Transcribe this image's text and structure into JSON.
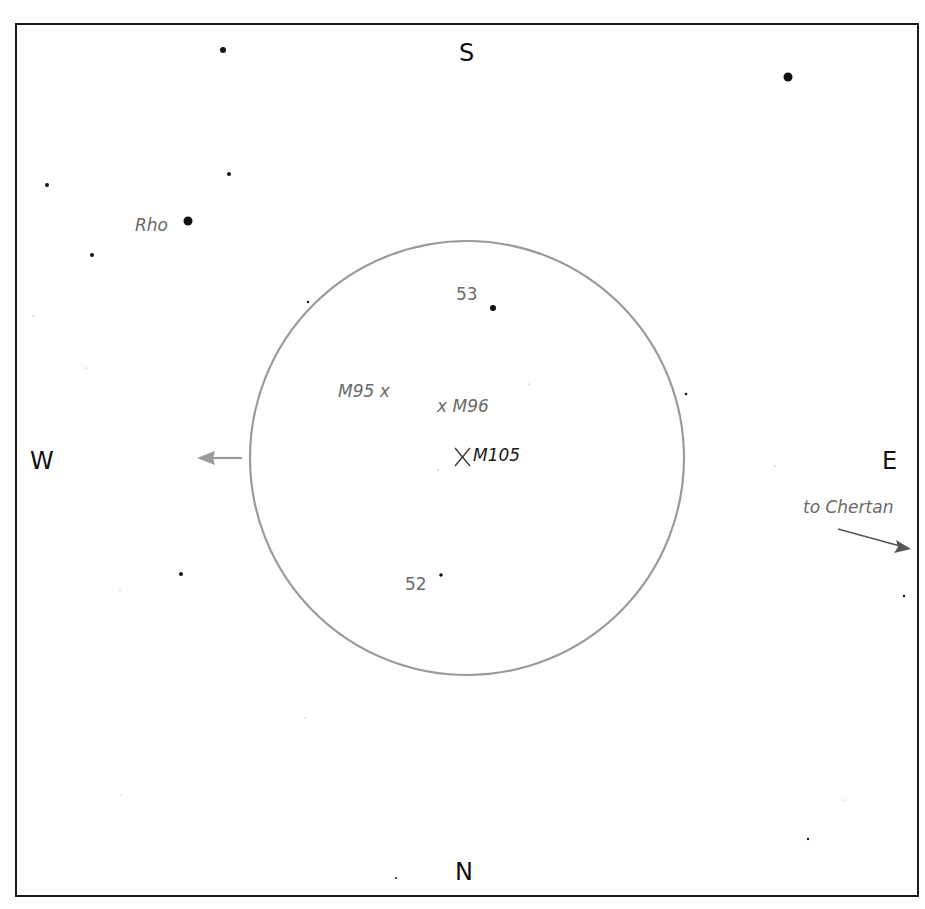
{
  "directions": {
    "north": "N",
    "south": "S",
    "east": "E",
    "west": "W"
  },
  "field_of_view": {
    "center": [
      467,
      458
    ],
    "radius": 217,
    "color": "#9a9a9a"
  },
  "objects": {
    "m105": {
      "label": "M105",
      "marker": "x-cross-icon"
    },
    "m96": {
      "label": "x M96"
    },
    "m95": {
      "label": "M95 x"
    }
  },
  "stars": {
    "rho": {
      "label": "Rho"
    },
    "star53": {
      "label": "53"
    },
    "star52": {
      "label": "52"
    }
  },
  "annotations": {
    "to_chertan": "to Chertan"
  },
  "star_points": [
    {
      "x": 223,
      "y": 50,
      "r": 3
    },
    {
      "x": 788,
      "y": 77,
      "r": 4.5
    },
    {
      "x": 47,
      "y": 185,
      "r": 2
    },
    {
      "x": 229,
      "y": 174,
      "r": 2
    },
    {
      "x": 188,
      "y": 221,
      "r": 4.5
    },
    {
      "x": 92,
      "y": 255,
      "r": 2
    },
    {
      "x": 493,
      "y": 308,
      "r": 3
    },
    {
      "x": 308,
      "y": 302,
      "r": 1.2
    },
    {
      "x": 686,
      "y": 394,
      "r": 1.3
    },
    {
      "x": 181,
      "y": 574,
      "r": 2
    },
    {
      "x": 441,
      "y": 575,
      "r": 1.8
    },
    {
      "x": 904,
      "y": 596,
      "r": 1.2
    },
    {
      "x": 808,
      "y": 839,
      "r": 1.2
    },
    {
      "x": 396,
      "y": 878,
      "r": 1
    },
    {
      "x": 33,
      "y": 316,
      "r": 0.6
    },
    {
      "x": 86,
      "y": 368,
      "r": 0.6
    },
    {
      "x": 529,
      "y": 384,
      "r": 0.6
    },
    {
      "x": 775,
      "y": 466,
      "r": 0.6
    },
    {
      "x": 438,
      "y": 470,
      "r": 0.6
    },
    {
      "x": 120,
      "y": 590,
      "r": 0.6
    },
    {
      "x": 305,
      "y": 718,
      "r": 0.5
    },
    {
      "x": 121,
      "y": 795,
      "r": 0.5
    },
    {
      "x": 845,
      "y": 800,
      "r": 0.5
    }
  ]
}
